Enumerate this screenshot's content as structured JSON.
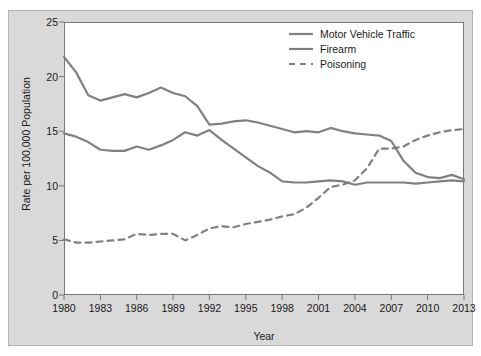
{
  "chart_data": {
    "type": "line",
    "title": "",
    "xlabel": "Year",
    "ylabel": "Rate per 100,000 Population",
    "xlim": [
      1980,
      2013
    ],
    "ylim": [
      0,
      25
    ],
    "yticks": [
      0,
      5,
      10,
      15,
      20,
      25
    ],
    "xticks": [
      1980,
      1983,
      1986,
      1989,
      1992,
      1995,
      1998,
      2001,
      2004,
      2007,
      2010,
      2013
    ],
    "grid": false,
    "legend_position": "top-right",
    "x": [
      1980,
      1981,
      1982,
      1983,
      1984,
      1985,
      1986,
      1987,
      1988,
      1989,
      1990,
      1991,
      1992,
      1993,
      1994,
      1995,
      1996,
      1997,
      1998,
      1999,
      2000,
      2001,
      2002,
      2003,
      2004,
      2005,
      2006,
      2007,
      2008,
      2009,
      2010,
      2011,
      2012,
      2013
    ],
    "series": [
      {
        "name": "Motor Vehicle Traffic",
        "style": "solid",
        "color": "#808080",
        "values": [
          21.8,
          20.4,
          18.3,
          17.8,
          18.1,
          18.4,
          18.1,
          18.5,
          19.0,
          18.5,
          18.2,
          17.3,
          15.6,
          15.7,
          15.9,
          16.0,
          15.8,
          15.5,
          15.2,
          14.9,
          15.0,
          14.9,
          15.3,
          15.0,
          14.8,
          14.7,
          14.6,
          14.1,
          12.3,
          11.2,
          10.8,
          10.7,
          11.0,
          10.6
        ]
      },
      {
        "name": "Firearm",
        "style": "solid",
        "color": "#808080",
        "values": [
          14.8,
          14.5,
          14.0,
          13.3,
          13.2,
          13.2,
          13.6,
          13.3,
          13.7,
          14.2,
          14.9,
          14.6,
          15.1,
          14.2,
          13.4,
          12.6,
          11.8,
          11.2,
          10.4,
          10.3,
          10.3,
          10.4,
          10.5,
          10.4,
          10.1,
          10.3,
          10.3,
          10.3,
          10.3,
          10.2,
          10.3,
          10.4,
          10.5,
          10.4
        ]
      },
      {
        "name": "Poisoning",
        "style": "dashed",
        "color": "#808080",
        "values": [
          5.1,
          4.8,
          4.8,
          4.9,
          5.0,
          5.1,
          5.6,
          5.5,
          5.6,
          5.6,
          5.0,
          5.5,
          6.1,
          6.3,
          6.2,
          6.5,
          6.7,
          6.9,
          7.2,
          7.4,
          8.0,
          8.9,
          9.9,
          10.1,
          10.5,
          11.6,
          13.4,
          13.4,
          13.6,
          14.2,
          14.6,
          14.9,
          15.1,
          15.2
        ]
      }
    ]
  },
  "axes": {
    "ylabel": "Rate per 100,000 Population",
    "xlabel": "Year",
    "ytick_labels": [
      "0",
      "5",
      "10",
      "15",
      "20",
      "25"
    ],
    "xtick_labels": [
      "1980",
      "1983",
      "1986",
      "1989",
      "1992",
      "1995",
      "1998",
      "2001",
      "2004",
      "2007",
      "2010",
      "2013"
    ]
  },
  "legend": {
    "items": [
      {
        "label": "Motor Vehicle Traffic",
        "style": "solid"
      },
      {
        "label": "Firearm",
        "style": "solid"
      },
      {
        "label": "Poisoning",
        "style": "dashed"
      }
    ]
  },
  "colors": {
    "line": "#808080",
    "panel": "#d9d9d9",
    "plot_background": "#ffffff",
    "axis": "#777777",
    "text": "#1a1a1a"
  }
}
